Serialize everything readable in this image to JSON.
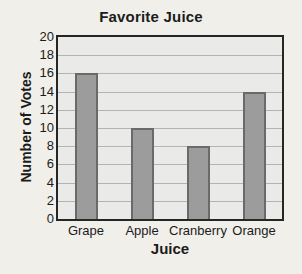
{
  "page": {
    "background": "#f0efe9"
  },
  "chart_data": {
    "type": "bar",
    "title": "Favorite Juice",
    "xlabel": "Juice",
    "ylabel": "Number of Votes",
    "categories": [
      "Grape",
      "Apple",
      "Cranberry",
      "Orange"
    ],
    "values": [
      16,
      10,
      8,
      14
    ],
    "ylim": [
      0,
      20
    ],
    "ytick_step": 2,
    "ytick_labels": [
      "20",
      "18",
      "16",
      "14",
      "12",
      "10",
      "8",
      "6",
      "4",
      "2",
      "0"
    ],
    "grid": "horizontal",
    "legend": "none",
    "bar_width_px": 23,
    "colors": {
      "bar_fill": "#9c9c9c",
      "bar_border": "#6a6a6a",
      "plot_background": "#eaeae8",
      "plot_border": "#262626",
      "gridline": "#b4b4b2",
      "text": "#1c1c1c"
    }
  }
}
